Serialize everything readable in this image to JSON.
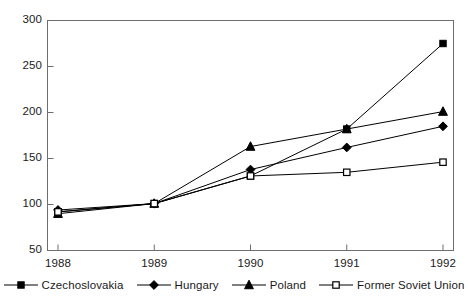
{
  "chart_data": {
    "type": "line",
    "title": "",
    "subtitle": "",
    "xlabel": "",
    "ylabel": "",
    "categories": [
      "1988",
      "1989",
      "1990",
      "1991",
      "1992"
    ],
    "x_tick_labels": [
      "1988",
      "1989",
      "1990",
      "1991",
      "1992"
    ],
    "y_tick_labels": [
      "50",
      "100",
      "150",
      "200",
      "250",
      "300"
    ],
    "y_ticks": [
      50,
      100,
      150,
      200,
      250,
      300
    ],
    "ylim": [
      50,
      300
    ],
    "grid": false,
    "legend_position": "bottom",
    "series": [
      {
        "name": "Czechoslovakia",
        "marker": "filled-square",
        "color": "#000000",
        "values": [
          92,
          101,
          131,
          182,
          275
        ]
      },
      {
        "name": "Hungary",
        "marker": "filled-diamond",
        "color": "#000000",
        "values": [
          94,
          101,
          138,
          162,
          185
        ]
      },
      {
        "name": "Poland",
        "marker": "filled-triangle",
        "color": "#000000",
        "values": [
          90,
          101,
          163,
          182,
          201
        ]
      },
      {
        "name": "Former Soviet Union",
        "marker": "open-square",
        "color": "#000000",
        "values": [
          92,
          101,
          131,
          135,
          146
        ]
      }
    ]
  },
  "legend": {
    "items": [
      {
        "label": "Czechoslovakia",
        "marker": "filled-square"
      },
      {
        "label": "Hungary",
        "marker": "filled-diamond"
      },
      {
        "label": "Poland",
        "marker": "filled-triangle"
      },
      {
        "label": "Former Soviet Union",
        "marker": "open-square"
      }
    ]
  },
  "axes": {
    "x_ticks": [
      "1988",
      "1989",
      "1990",
      "1991",
      "1992"
    ],
    "y_ticks": [
      "300",
      "250",
      "200",
      "150",
      "100",
      "50"
    ]
  },
  "colors": {
    "line": "#000000",
    "frame": "#6e6e6e",
    "text": "#1a1a1a",
    "background": "#ffffff"
  }
}
